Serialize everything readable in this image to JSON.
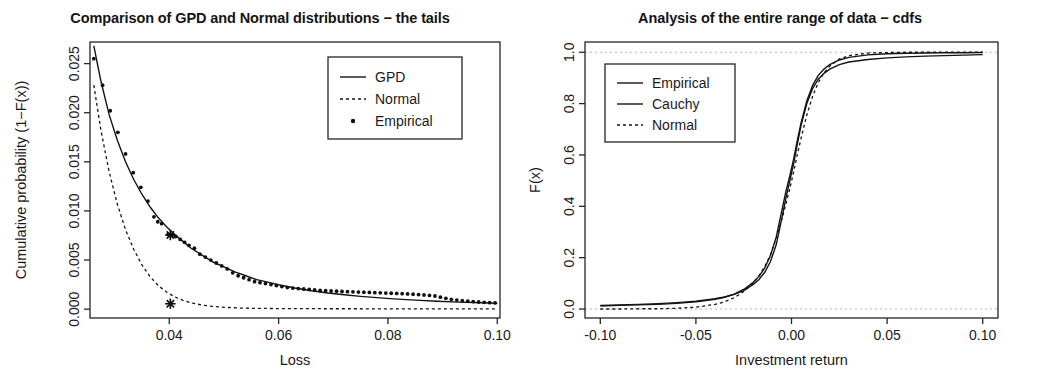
{
  "figure": {
    "panel_count": 2,
    "background_color": "#ffffff",
    "line_color": "#141414"
  },
  "left_panel": {
    "title": "Comparison of GPD and Normal distributions − the tails",
    "xlabel": "Loss",
    "ylabel": "Cumulative probability (1−F(x))",
    "xticks": [
      "0.04",
      "0.06",
      "0.08",
      "0.10"
    ],
    "yticks": [
      "0.000",
      "0.005",
      "0.010",
      "0.015",
      "0.020",
      "0.025"
    ],
    "legend": {
      "items": [
        {
          "label": "GPD",
          "style": "solid-line"
        },
        {
          "label": "Normal",
          "style": "dashed-line"
        },
        {
          "label": "Empirical",
          "style": "point"
        }
      ]
    }
  },
  "right_panel": {
    "title": "Analysis of the entire range of data − cdfs",
    "xlabel": "Investment return",
    "ylabel": "F(x)",
    "xticks": [
      "-0.10",
      "-0.05",
      "0.00",
      "0.05",
      "0.10"
    ],
    "yticks": [
      "0.0",
      "0.2",
      "0.4",
      "0.6",
      "0.8",
      "1.0"
    ],
    "legend": {
      "items": [
        {
          "label": "Empirical",
          "style": "solid-line"
        },
        {
          "label": "Cauchy",
          "style": "solid-line"
        },
        {
          "label": "Normal",
          "style": "dashed-line"
        }
      ]
    }
  },
  "chart_data": [
    {
      "type": "line",
      "id": "tails",
      "title": "Comparison of GPD and Normal distributions − the tails",
      "xlabel": "Loss",
      "ylabel": "Cumulative probability (1−F(x))",
      "xlim": [
        0.0255,
        0.1005
      ],
      "ylim": [
        -0.0009,
        0.0272
      ],
      "xticks": [
        0.04,
        0.06,
        0.08,
        0.1
      ],
      "yticks": [
        0.0,
        0.005,
        0.01,
        0.015,
        0.02,
        0.025
      ],
      "grid": false,
      "legend_position": "top-right",
      "series": [
        {
          "name": "GPD",
          "style": "solid-line",
          "x": [
            0.0262,
            0.0275,
            0.029,
            0.0305,
            0.032,
            0.0335,
            0.035,
            0.0365,
            0.038,
            0.0395,
            0.041,
            0.0425,
            0.044,
            0.046,
            0.048,
            0.05,
            0.052,
            0.054,
            0.056,
            0.058,
            0.06,
            0.063,
            0.066,
            0.069,
            0.072,
            0.075,
            0.078,
            0.081,
            0.085,
            0.089,
            0.093,
            0.097,
            0.1
          ],
          "y": [
            0.0268,
            0.0232,
            0.0198,
            0.0172,
            0.015,
            0.0132,
            0.0117,
            0.0104,
            0.0093,
            0.0084,
            0.0076,
            0.0069,
            0.0062,
            0.0055,
            0.0048,
            0.0043,
            0.0038,
            0.0034,
            0.003,
            0.00275,
            0.00249,
            0.00215,
            0.00187,
            0.00164,
            0.00146,
            0.0013,
            0.00117,
            0.00105,
            0.00092,
            0.00081,
            0.00072,
            0.00065,
            0.0006
          ]
        },
        {
          "name": "Normal",
          "style": "dashed-line",
          "x": [
            0.0262,
            0.0275,
            0.029,
            0.0305,
            0.032,
            0.0335,
            0.035,
            0.0365,
            0.038,
            0.0395,
            0.041,
            0.0425,
            0.044,
            0.046,
            0.048,
            0.05,
            0.053,
            0.056,
            0.06,
            0.065,
            0.07,
            0.075,
            0.08,
            0.085,
            0.09,
            0.095,
            0.1
          ],
          "y": [
            0.0228,
            0.0182,
            0.014,
            0.0107,
            0.0081,
            0.0061,
            0.0045,
            0.0033,
            0.0024,
            0.00175,
            0.00125,
            0.0009,
            0.00064,
            0.00042,
            0.00028,
            0.00019,
            0.00011,
            8e-05,
            6e-05,
            5e-05,
            4e-05,
            4e-05,
            3e-05,
            3e-05,
            3e-05,
            2e-05,
            2e-05
          ]
        },
        {
          "name": "Empirical",
          "style": "point",
          "x": [
            0.0262,
            0.0278,
            0.0292,
            0.0306,
            0.032,
            0.0334,
            0.0348,
            0.0361,
            0.0372,
            0.0379,
            0.0386,
            0.0398,
            0.0405,
            0.0412,
            0.042,
            0.0428,
            0.0436,
            0.0446,
            0.0456,
            0.0466,
            0.0476,
            0.0486,
            0.0496,
            0.0506,
            0.0516,
            0.0526,
            0.0536,
            0.0546,
            0.0556,
            0.0566,
            0.0576,
            0.0586,
            0.0596,
            0.0606,
            0.0616,
            0.0626,
            0.0636,
            0.0646,
            0.0656,
            0.0666,
            0.0676,
            0.0686,
            0.0696,
            0.0706,
            0.0716,
            0.0726,
            0.0736,
            0.0746,
            0.0756,
            0.0766,
            0.0776,
            0.0786,
            0.0796,
            0.0806,
            0.0816,
            0.0826,
            0.0836,
            0.0846,
            0.0856,
            0.0866,
            0.0876,
            0.0886,
            0.0896,
            0.0906,
            0.0916,
            0.0926,
            0.0936,
            0.0946,
            0.0956,
            0.0966,
            0.0976,
            0.0986,
            0.0996
          ],
          "y": [
            0.0255,
            0.0228,
            0.0202,
            0.018,
            0.0158,
            0.0139,
            0.0124,
            0.011,
            0.0094,
            0.0089,
            0.0087,
            0.0076,
            0.0075,
            0.0074,
            0.0071,
            0.0068,
            0.0065,
            0.0062,
            0.0056,
            0.0053,
            0.005,
            0.0047,
            0.0044,
            0.0041,
            0.0037,
            0.0034,
            0.0032,
            0.003,
            0.0028,
            0.0027,
            0.0026,
            0.0025,
            0.0024,
            0.0023,
            0.0022,
            0.00215,
            0.0021,
            0.00205,
            0.002,
            0.00195,
            0.0019,
            0.00188,
            0.00185,
            0.00183,
            0.0018,
            0.00178,
            0.00176,
            0.00174,
            0.00172,
            0.0017,
            0.00168,
            0.00166,
            0.00164,
            0.00162,
            0.0016,
            0.00158,
            0.00155,
            0.00152,
            0.00148,
            0.00144,
            0.0014,
            0.00134,
            0.00122,
            0.0011,
            0.001,
            0.00092,
            0.00086,
            0.00081,
            0.00077,
            0.00073,
            0.0007,
            0.00066,
            0.00063
          ]
        }
      ],
      "annotations": [
        {
          "label": "star-gpd",
          "x": 0.0402,
          "y": 0.00755,
          "marker": "asterisk"
        },
        {
          "label": "star-normal",
          "x": 0.0402,
          "y": 0.00055,
          "marker": "asterisk"
        }
      ]
    },
    {
      "type": "line",
      "id": "cdfs",
      "title": "Analysis of the entire range of data − cdfs",
      "xlabel": "Investment return",
      "ylabel": "F(x)",
      "xlim": [
        -0.108,
        0.108
      ],
      "ylim": [
        -0.035,
        1.04
      ],
      "xticks": [
        -0.1,
        -0.05,
        0.0,
        0.05,
        0.1
      ],
      "yticks": [
        0.0,
        0.2,
        0.4,
        0.6,
        0.8,
        1.0
      ],
      "grid": false,
      "legend_position": "top-left",
      "reference_lines": [
        {
          "y": 1.0,
          "style": "dotted"
        },
        {
          "y": 0.0,
          "style": "dotted"
        }
      ],
      "series": [
        {
          "name": "Empirical",
          "style": "solid-line",
          "x": [
            -0.1,
            -0.09,
            -0.08,
            -0.07,
            -0.06,
            -0.05,
            -0.04,
            -0.035,
            -0.03,
            -0.025,
            -0.02,
            -0.017,
            -0.014,
            -0.011,
            -0.008,
            -0.005,
            -0.003,
            -0.001,
            0.001,
            0.003,
            0.005,
            0.008,
            0.011,
            0.014,
            0.017,
            0.02,
            0.025,
            0.03,
            0.04,
            0.05,
            0.06,
            0.07,
            0.08,
            0.09,
            0.1
          ],
          "y": [
            0.014,
            0.016,
            0.018,
            0.021,
            0.025,
            0.03,
            0.04,
            0.047,
            0.057,
            0.072,
            0.096,
            0.115,
            0.143,
            0.185,
            0.25,
            0.355,
            0.43,
            0.495,
            0.562,
            0.64,
            0.715,
            0.8,
            0.858,
            0.895,
            0.918,
            0.934,
            0.952,
            0.962,
            0.972,
            0.978,
            0.982,
            0.985,
            0.987,
            0.989,
            0.991
          ]
        },
        {
          "name": "Cauchy",
          "style": "solid-line",
          "x": [
            -0.1,
            -0.09,
            -0.08,
            -0.07,
            -0.06,
            -0.05,
            -0.04,
            -0.035,
            -0.03,
            -0.025,
            -0.02,
            -0.017,
            -0.014,
            -0.011,
            -0.008,
            -0.005,
            -0.003,
            -0.001,
            0.001,
            0.003,
            0.005,
            0.008,
            0.011,
            0.014,
            0.017,
            0.02,
            0.025,
            0.03,
            0.04,
            0.05,
            0.06,
            0.07,
            0.08,
            0.09,
            0.1
          ],
          "y": [
            0.012,
            0.014,
            0.016,
            0.018,
            0.022,
            0.028,
            0.038,
            0.046,
            0.058,
            0.076,
            0.104,
            0.127,
            0.16,
            0.208,
            0.28,
            0.385,
            0.455,
            0.515,
            0.58,
            0.655,
            0.725,
            0.81,
            0.87,
            0.91,
            0.935,
            0.952,
            0.97,
            0.98,
            0.99,
            0.994,
            0.996,
            0.997,
            0.998,
            0.998,
            0.999
          ]
        },
        {
          "name": "Normal",
          "style": "dashed-line",
          "x": [
            -0.1,
            -0.09,
            -0.08,
            -0.07,
            -0.06,
            -0.05,
            -0.04,
            -0.035,
            -0.03,
            -0.025,
            -0.02,
            -0.017,
            -0.014,
            -0.011,
            -0.008,
            -0.005,
            -0.003,
            -0.001,
            0.001,
            0.003,
            0.005,
            0.008,
            0.011,
            0.014,
            0.017,
            0.02,
            0.025,
            0.03,
            0.04,
            0.05,
            0.06,
            0.07,
            0.08,
            0.09,
            0.1
          ],
          "y": [
            0.0,
            0.0,
            0.001,
            0.001,
            0.003,
            0.007,
            0.018,
            0.028,
            0.044,
            0.068,
            0.102,
            0.13,
            0.165,
            0.212,
            0.275,
            0.35,
            0.408,
            0.465,
            0.53,
            0.6,
            0.665,
            0.755,
            0.828,
            0.882,
            0.92,
            0.946,
            0.974,
            0.987,
            0.997,
            0.999,
            1.0,
            1.0,
            1.0,
            1.0,
            1.0
          ]
        }
      ]
    }
  ]
}
